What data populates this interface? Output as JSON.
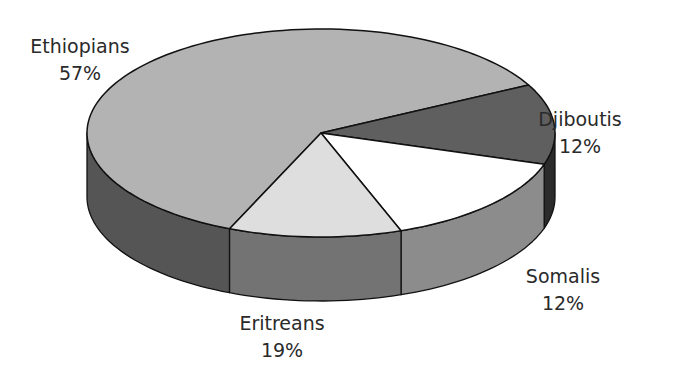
{
  "chart_data": {
    "type": "pie",
    "style": "3d-exploded-none",
    "title": "",
    "categories": [
      "Ethiopians",
      "Djiboutis",
      "Somalis",
      "Eritreans"
    ],
    "values": [
      57,
      12,
      12,
      19
    ],
    "labels": [
      {
        "name": "Ethiopians",
        "pct": "57%"
      },
      {
        "name": "Djiboutis",
        "pct": "12%"
      },
      {
        "name": "Somalis",
        "pct": "12%"
      },
      {
        "name": "Eritreans",
        "pct": "19%"
      }
    ],
    "colors": {
      "Ethiopians": {
        "top": "#b3b3b3",
        "side": "#555555"
      },
      "Djiboutis": {
        "top": "#5f5f5f",
        "side": "#2b2b2b"
      },
      "Somalis": {
        "top": "#ffffff",
        "side": "#8c8c8c"
      },
      "Eritreans": {
        "top": "#dedede",
        "side": "#737373"
      }
    },
    "legend": "none (direct labels)"
  },
  "geometry": {
    "cx": 321,
    "cy": 133,
    "rx": 234,
    "ry": 104,
    "depth": 64,
    "boundary_angles_deg": [
      -27.5,
      17.5,
      70,
      113
    ]
  }
}
